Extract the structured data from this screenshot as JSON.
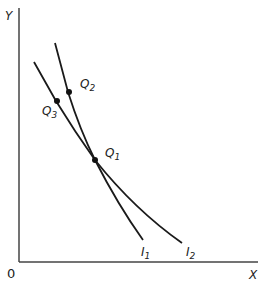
{
  "diagram": {
    "axes": {
      "y_label": "Y",
      "x_label": "X",
      "origin_label": "0"
    },
    "curves": [
      {
        "name": "I",
        "sub": "1"
      },
      {
        "name": "I",
        "sub": "2"
      }
    ],
    "points": [
      {
        "name": "Q",
        "sub": "1"
      },
      {
        "name": "Q",
        "sub": "2"
      },
      {
        "name": "Q",
        "sub": "3"
      }
    ],
    "colors": {
      "line": "#1a1a1a",
      "axis": "#444444"
    }
  }
}
